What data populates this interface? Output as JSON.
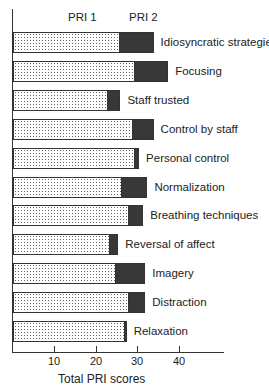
{
  "chart_data": {
    "type": "bar",
    "orientation": "horizontal",
    "stacked": true,
    "title": "",
    "xlabel": "Total PRI scores",
    "ylabel": "",
    "xlim": [
      0,
      50
    ],
    "xticks": [
      10,
      20,
      30,
      40
    ],
    "grid": false,
    "legend": [
      "PRI 1",
      "PRI 2"
    ],
    "legend_position": "top",
    "categories": [
      "Idiosyncratic strategies",
      "Focusing",
      "Staff trusted",
      "Control by staff",
      "Personal control",
      "Normalization",
      "Breathing techniques",
      "Reversal of affect",
      "Imagery",
      "Distraction",
      "Relaxation"
    ],
    "series": [
      {
        "name": "PRI 1",
        "values": [
          26,
          29.5,
          23,
          29,
          29.5,
          26.5,
          28,
          23.5,
          25,
          28,
          27
        ]
      },
      {
        "name": "PRI 2",
        "values": [
          8,
          8,
          3,
          5,
          1,
          6,
          3.5,
          2,
          7,
          4,
          0.5
        ]
      }
    ],
    "totals": [
      34,
      37.5,
      26,
      34,
      30.5,
      32.5,
      31.5,
      25.5,
      32,
      32,
      27.5
    ]
  },
  "labels": {
    "legend_pri1": "PRI 1",
    "legend_pri2": "PRI 2",
    "tick_10": "10",
    "tick_20": "20",
    "tick_30": "30",
    "tick_40": "40",
    "xlabel": "Total PRI scores"
  }
}
